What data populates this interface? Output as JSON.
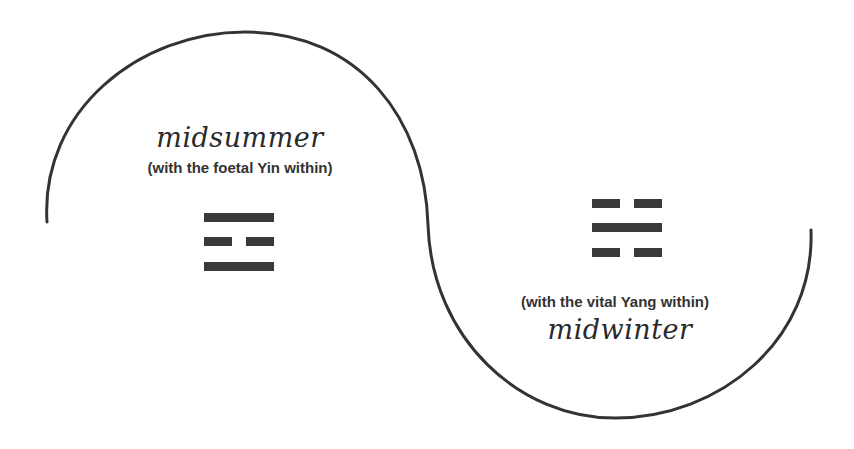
{
  "diagram": {
    "type": "yin-yang S-curve with trigrams",
    "colors": {
      "stroke": "#333333",
      "text": "#2a2a2a",
      "bars": "#3a3a3a",
      "background": "#ffffff"
    },
    "upper": {
      "season": "midsummer",
      "note": "(with the foetal Yin within)",
      "trigram": {
        "name": "Li",
        "lines_top_to_bottom": [
          "solid",
          "broken",
          "solid"
        ]
      }
    },
    "lower": {
      "season": "midwinter",
      "note": "(with the vital Yang within)",
      "trigram": {
        "name": "Kan",
        "lines_top_to_bottom": [
          "broken",
          "solid",
          "broken"
        ]
      }
    }
  }
}
